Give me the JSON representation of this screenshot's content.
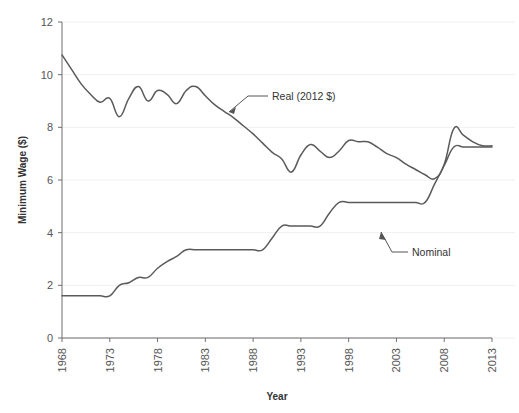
{
  "chart_data": {
    "type": "line",
    "title": "",
    "xlabel": "Year",
    "ylabel": "Minimum Wage ($)",
    "xlim": [
      1968,
      2013
    ],
    "ylim": [
      0,
      12
    ],
    "xticks": [
      1968,
      1973,
      1978,
      1983,
      1988,
      1993,
      1998,
      2003,
      2008,
      2013
    ],
    "yticks": [
      0,
      2,
      4,
      6,
      8,
      10,
      12
    ],
    "grid": true,
    "legend_position": "inline-annotations",
    "annotations": [
      {
        "text": "Real (2012 $)",
        "points_to_year": 1982,
        "points_to_value": 8.7
      },
      {
        "text": "Nominal",
        "points_to_year": 2003,
        "points_to_value": 5.15
      }
    ],
    "series": [
      {
        "name": "Real (2012 $)",
        "x": [
          1968,
          1969,
          1970,
          1971,
          1972,
          1973,
          1974,
          1975,
          1976,
          1977,
          1978,
          1979,
          1980,
          1981,
          1982,
          1983,
          1984,
          1985,
          1986,
          1987,
          1988,
          1989,
          1990,
          1991,
          1992,
          1993,
          1994,
          1995,
          1996,
          1997,
          1998,
          1999,
          2000,
          2001,
          2002,
          2003,
          2004,
          2005,
          2006,
          2007,
          2008,
          2009,
          2010,
          2011,
          2012,
          2013
        ],
        "values": [
          10.75,
          10.2,
          9.65,
          9.25,
          8.95,
          9.1,
          8.4,
          9.1,
          9.55,
          9.0,
          9.4,
          9.25,
          8.9,
          9.4,
          9.55,
          9.2,
          8.85,
          8.6,
          8.35,
          8.05,
          7.75,
          7.4,
          7.05,
          6.8,
          6.3,
          6.95,
          7.35,
          7.1,
          6.85,
          7.1,
          7.5,
          7.45,
          7.45,
          7.25,
          7.0,
          6.85,
          6.6,
          6.4,
          6.2,
          6.05,
          6.6,
          7.95,
          7.7,
          7.45,
          7.3,
          7.3
        ]
      },
      {
        "name": "Nominal",
        "x": [
          1968,
          1969,
          1970,
          1971,
          1972,
          1973,
          1974,
          1975,
          1976,
          1977,
          1978,
          1979,
          1980,
          1981,
          1982,
          1983,
          1984,
          1985,
          1986,
          1987,
          1988,
          1989,
          1990,
          1991,
          1992,
          1993,
          1994,
          1995,
          1996,
          1997,
          1998,
          1999,
          2000,
          2001,
          2002,
          2003,
          2004,
          2005,
          2006,
          2007,
          2008,
          2009,
          2010,
          2011,
          2012,
          2013
        ],
        "values": [
          1.6,
          1.6,
          1.6,
          1.6,
          1.6,
          1.6,
          2.0,
          2.1,
          2.3,
          2.3,
          2.65,
          2.9,
          3.1,
          3.35,
          3.35,
          3.35,
          3.35,
          3.35,
          3.35,
          3.35,
          3.35,
          3.35,
          3.8,
          4.25,
          4.25,
          4.25,
          4.25,
          4.25,
          4.75,
          5.15,
          5.15,
          5.15,
          5.15,
          5.15,
          5.15,
          5.15,
          5.15,
          5.15,
          5.15,
          5.85,
          6.55,
          7.25,
          7.25,
          7.25,
          7.25,
          7.25
        ]
      }
    ]
  },
  "axes": {
    "y_title": "Minimum Wage ($)",
    "x_title": "Year",
    "y_tick_labels": [
      "0",
      "2",
      "4",
      "6",
      "8",
      "10",
      "12"
    ],
    "x_tick_labels": [
      "1968",
      "1973",
      "1978",
      "1983",
      "1988",
      "1993",
      "1998",
      "2003",
      "2008",
      "2013"
    ]
  },
  "annotations": {
    "real_label": "Real (2012 $)",
    "nominal_label": "Nominal"
  },
  "colors": {
    "line": "#5a5a5a",
    "axis": "#6f6f6f",
    "grid": "#f0f0f0",
    "text": "#333333",
    "background": "#ffffff"
  }
}
